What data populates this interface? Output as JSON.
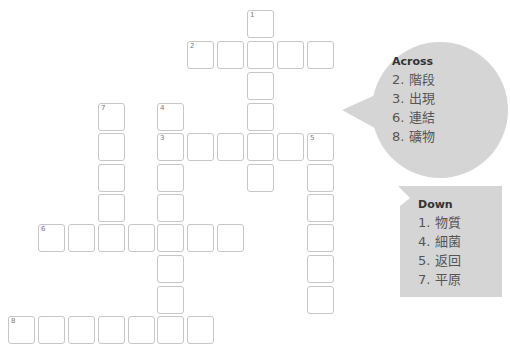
{
  "puzzle": {
    "cell_size": 27,
    "cell_pitch_x": 30,
    "cell_pitch_y": 30.5,
    "colors": {
      "cell_border": "#c6c6c6",
      "bubble_fill": "#d5d5d5",
      "clue_text": "#555555",
      "title_text": "#333333"
    },
    "cells": [
      {
        "x": 247,
        "y": 10,
        "num": "1"
      },
      {
        "x": 187,
        "y": 41,
        "num": "2"
      },
      {
        "x": 217,
        "y": 41
      },
      {
        "x": 247,
        "y": 41
      },
      {
        "x": 277,
        "y": 41
      },
      {
        "x": 307,
        "y": 41
      },
      {
        "x": 247,
        "y": 72
      },
      {
        "x": 98,
        "y": 103,
        "num": "7"
      },
      {
        "x": 157,
        "y": 103,
        "num": "4"
      },
      {
        "x": 247,
        "y": 103
      },
      {
        "x": 98,
        "y": 133
      },
      {
        "x": 157,
        "y": 133,
        "num": "3"
      },
      {
        "x": 187,
        "y": 133
      },
      {
        "x": 217,
        "y": 133
      },
      {
        "x": 247,
        "y": 133
      },
      {
        "x": 277,
        "y": 133
      },
      {
        "x": 307,
        "y": 133,
        "num": "5"
      },
      {
        "x": 98,
        "y": 164
      },
      {
        "x": 157,
        "y": 164
      },
      {
        "x": 247,
        "y": 164
      },
      {
        "x": 307,
        "y": 164
      },
      {
        "x": 98,
        "y": 194
      },
      {
        "x": 157,
        "y": 194
      },
      {
        "x": 307,
        "y": 194
      },
      {
        "x": 38,
        "y": 224,
        "num": "6"
      },
      {
        "x": 68,
        "y": 224
      },
      {
        "x": 98,
        "y": 224
      },
      {
        "x": 128,
        "y": 224
      },
      {
        "x": 157,
        "y": 224
      },
      {
        "x": 187,
        "y": 224
      },
      {
        "x": 217,
        "y": 224
      },
      {
        "x": 307,
        "y": 224
      },
      {
        "x": 157,
        "y": 255
      },
      {
        "x": 307,
        "y": 255
      },
      {
        "x": 157,
        "y": 286
      },
      {
        "x": 307,
        "y": 286
      },
      {
        "x": 8,
        "y": 316,
        "num": "8"
      },
      {
        "x": 38,
        "y": 316
      },
      {
        "x": 68,
        "y": 316
      },
      {
        "x": 98,
        "y": 316
      },
      {
        "x": 128,
        "y": 316
      },
      {
        "x": 157,
        "y": 316
      },
      {
        "x": 187,
        "y": 316
      }
    ]
  },
  "across": {
    "title": "Across",
    "clues": [
      "2. 階段",
      "3. 出現",
      "6. 連結",
      "8. 礦物"
    ]
  },
  "down": {
    "title": "Down",
    "clues": [
      "1. 物質",
      "4. 細菌",
      "5. 返回",
      "7. 平原"
    ]
  }
}
